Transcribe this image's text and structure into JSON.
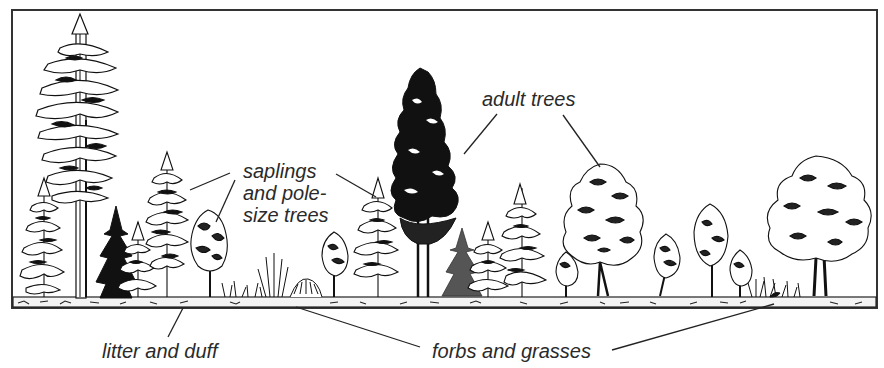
{
  "diagram": {
    "colors": {
      "ink": "#1a1a1a",
      "frame": "#333333",
      "paper": "#ffffff",
      "ground_fill": "#f4f4f4"
    },
    "labels": {
      "adult_trees": "adult trees",
      "saplings_line1": "saplings",
      "saplings_line2": "and pole-",
      "saplings_line3": "size trees",
      "litter": "litter and duff",
      "forbs": "forbs and grasses"
    },
    "elements": [
      {
        "kind": "conifer-tall",
        "x": 80,
        "top": 14
      },
      {
        "kind": "conifer-dark-adult",
        "x": 422,
        "top": 68
      },
      {
        "kind": "deciduous-adult",
        "x": 603,
        "top": 162
      },
      {
        "kind": "deciduous-adult",
        "x": 818,
        "top": 156
      },
      {
        "kind": "sapling-conifer",
        "x": 165,
        "top": 152
      },
      {
        "kind": "sapling-deciduous",
        "x": 208,
        "top": 208
      },
      {
        "kind": "sapling-conifer",
        "x": 377,
        "top": 178
      },
      {
        "kind": "ground-litter",
        "y": 297
      },
      {
        "kind": "forbs-grasses",
        "x": 290
      },
      {
        "kind": "forbs-grasses",
        "x": 775
      }
    ]
  }
}
